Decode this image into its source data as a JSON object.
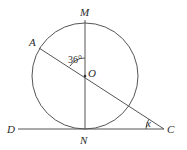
{
  "diagram": {
    "points": {
      "M": {
        "label": "M",
        "x": 85,
        "y": 22
      },
      "A": {
        "label": "A",
        "x": 39,
        "y": 48
      },
      "O": {
        "label": "O",
        "x": 85,
        "y": 76
      },
      "N": {
        "label": "N",
        "x": 85,
        "y": 129
      },
      "D": {
        "label": "D",
        "x": 18,
        "y": 129
      },
      "C": {
        "label": "C",
        "x": 164,
        "y": 129
      }
    },
    "circle": {
      "center": "O",
      "radius": 53
    },
    "angles": {
      "AOM": {
        "label": "36°"
      },
      "OCN": {
        "label": "x"
      }
    },
    "colors": {
      "line": "#555555",
      "text": "#2a2a2a"
    }
  }
}
